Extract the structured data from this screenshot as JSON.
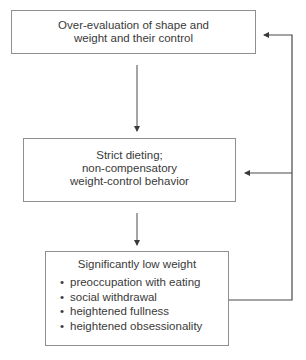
{
  "diagram": {
    "type": "flowchart",
    "nodes": [
      {
        "id": "overevaluation",
        "lines": [
          "Over-evaluation of shape and",
          "weight and their control"
        ]
      },
      {
        "id": "strict-dieting",
        "lines": [
          "Strict dieting;",
          "non-compensatory",
          "weight-control behavior"
        ]
      },
      {
        "id": "low-weight",
        "title": "Significantly low weight",
        "bullet": "•",
        "bullets": [
          "preoccupation with eating",
          "social withdrawal",
          "heightened fullness",
          "heightened obsessionality"
        ]
      }
    ],
    "edges": [
      {
        "from": "overevaluation",
        "to": "strict-dieting"
      },
      {
        "from": "strict-dieting",
        "to": "low-weight"
      },
      {
        "from": "low-weight",
        "to": "overevaluation"
      },
      {
        "from": "low-weight",
        "to": "strict-dieting"
      }
    ],
    "colors": {
      "line": "#4a4a4a",
      "border": "#8f8f8f",
      "text": "#3a3a3a"
    }
  }
}
